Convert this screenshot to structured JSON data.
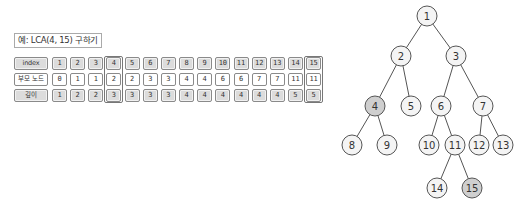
{
  "title": "예: LCA(4, 15) 구하기",
  "table": {
    "rows": [
      {
        "label": "index",
        "style": "grey",
        "values": [
          "1",
          "2",
          "3",
          "4",
          "5",
          "6",
          "7",
          "8",
          "9",
          "10",
          "11",
          "12",
          "13",
          "14",
          "15"
        ]
      },
      {
        "label": "부모 노드",
        "style": "white",
        "values": [
          "0",
          "1",
          "1",
          "2",
          "2",
          "3",
          "3",
          "4",
          "4",
          "6",
          "6",
          "7",
          "7",
          "11",
          "11"
        ]
      },
      {
        "label": "깊이",
        "style": "grey",
        "values": [
          "1",
          "2",
          "2",
          "3",
          "3",
          "3",
          "3",
          "4",
          "4",
          "4",
          "4",
          "4",
          "4",
          "5",
          "5"
        ]
      }
    ],
    "highlighted_columns": [
      4,
      15
    ]
  },
  "tree": {
    "nodes": [
      {
        "id": "1",
        "x": 427,
        "y": 16,
        "highlighted": false
      },
      {
        "id": "2",
        "x": 401,
        "y": 56,
        "highlighted": false
      },
      {
        "id": "3",
        "x": 456,
        "y": 56,
        "highlighted": false
      },
      {
        "id": "4",
        "x": 375,
        "y": 106,
        "highlighted": true
      },
      {
        "id": "5",
        "x": 411,
        "y": 106,
        "highlighted": false
      },
      {
        "id": "6",
        "x": 441,
        "y": 106,
        "highlighted": false
      },
      {
        "id": "7",
        "x": 483,
        "y": 106,
        "highlighted": false
      },
      {
        "id": "8",
        "x": 352,
        "y": 145,
        "highlighted": false
      },
      {
        "id": "9",
        "x": 387,
        "y": 145,
        "highlighted": false
      },
      {
        "id": "10",
        "x": 429,
        "y": 145,
        "highlighted": false
      },
      {
        "id": "11",
        "x": 455,
        "y": 145,
        "highlighted": false
      },
      {
        "id": "12",
        "x": 479,
        "y": 145,
        "highlighted": false
      },
      {
        "id": "13",
        "x": 503,
        "y": 145,
        "highlighted": false
      },
      {
        "id": "14",
        "x": 437,
        "y": 188,
        "highlighted": false
      },
      {
        "id": "15",
        "x": 472,
        "y": 188,
        "highlighted": true
      }
    ],
    "edges": [
      [
        "1",
        "2"
      ],
      [
        "1",
        "3"
      ],
      [
        "2",
        "4"
      ],
      [
        "2",
        "5"
      ],
      [
        "3",
        "6"
      ],
      [
        "3",
        "7"
      ],
      [
        "4",
        "8"
      ],
      [
        "4",
        "9"
      ],
      [
        "6",
        "10"
      ],
      [
        "6",
        "11"
      ],
      [
        "7",
        "12"
      ],
      [
        "7",
        "13"
      ],
      [
        "11",
        "14"
      ],
      [
        "11",
        "15"
      ]
    ]
  },
  "colors": {
    "node_fill": "#f4f4f4",
    "node_highlight_fill": "#cfcfcf",
    "node_stroke": "#555555",
    "edge": "#555555"
  }
}
